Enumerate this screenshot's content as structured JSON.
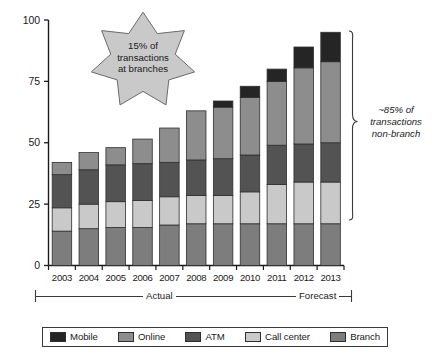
{
  "chart_data": {
    "type": "bar",
    "subtype": "stacked-vertical",
    "title": "",
    "xlabel": "",
    "ylabel": "",
    "ylim": [
      0,
      100
    ],
    "yticks": [
      0,
      25,
      50,
      75,
      100
    ],
    "ytick_labels": [
      "0",
      "25",
      "50",
      "75",
      "100"
    ],
    "grid": false,
    "legend_position": "bottom",
    "categories": [
      "2003",
      "2004",
      "2005",
      "2006",
      "2007",
      "2008",
      "2009",
      "2010",
      "2011",
      "2012",
      "2013"
    ],
    "series": [
      {
        "name": "Branch",
        "color": "#7d7d7d",
        "values": [
          14,
          15,
          15.5,
          15.5,
          16.5,
          17,
          17,
          17,
          17,
          17,
          17
        ]
      },
      {
        "name": "Call center",
        "color": "#c9c9c9",
        "values": [
          9.5,
          10,
          10.5,
          11,
          11.5,
          11.5,
          11.5,
          13,
          16,
          17,
          17
        ]
      },
      {
        "name": "ATM",
        "color": "#535353",
        "values": [
          13.5,
          14,
          15,
          15,
          14,
          14.5,
          15,
          15,
          16,
          15.5,
          16
        ]
      },
      {
        "name": "Online",
        "color": "#8d8d8d",
        "values": [
          5,
          7,
          7,
          10,
          14,
          20,
          21,
          23.5,
          26,
          31,
          33
        ]
      },
      {
        "name": "Mobile",
        "color": "#252525",
        "values": [
          0,
          0,
          0,
          0,
          0,
          0,
          2.5,
          4.5,
          5,
          8.5,
          12
        ]
      }
    ],
    "totals": [
      42,
      46,
      48,
      51.5,
      56,
      63,
      68,
      73,
      80,
      89,
      95
    ],
    "stack_order_bottom_to_top": [
      "Branch",
      "Call center",
      "ATM",
      "Online",
      "Mobile"
    ],
    "legend": [
      {
        "label": "Mobile",
        "color": "#252525"
      },
      {
        "label": "Online",
        "color": "#8d8d8d"
      },
      {
        "label": "ATM",
        "color": "#535353"
      },
      {
        "label": "Call center",
        "color": "#c9c9c9"
      },
      {
        "label": "Branch",
        "color": "#7d7d7d"
      }
    ],
    "annotations": {
      "star_callout": {
        "icon": "star-burst",
        "lines": [
          "15% of",
          "transactions",
          "at branches"
        ],
        "fill": "#c9c9c9"
      },
      "brace_note": {
        "icon": "curly-brace-right",
        "lines": [
          "~85% of",
          "transactions",
          "non-branch"
        ],
        "style": "italic"
      },
      "period_bands": [
        {
          "label": "Actual",
          "from": "2003",
          "to": "2010"
        },
        {
          "label": "Forecast",
          "from": "2011",
          "to": "2013"
        }
      ]
    }
  },
  "axis": {
    "y_labels": [
      "100",
      "75",
      "50",
      "25",
      "0"
    ],
    "x_labels": [
      "2003",
      "2004",
      "2005",
      "2006",
      "2007",
      "2008",
      "2009",
      "2010",
      "2011",
      "2012",
      "2013"
    ]
  },
  "callout": {
    "line1": "15% of",
    "line2": "transactions",
    "line3": "at branches"
  },
  "brace_note": {
    "line1": "~85% of",
    "line2": "transactions",
    "line3": "non-branch"
  },
  "periods": {
    "actual": "Actual",
    "forecast": "Forecast"
  },
  "legend": {
    "items": [
      {
        "label": "Mobile"
      },
      {
        "label": "Online"
      },
      {
        "label": "ATM"
      },
      {
        "label": "Call center"
      },
      {
        "label": "Branch"
      }
    ]
  },
  "colors": {
    "mobile": "#252525",
    "online": "#8d8d8d",
    "atm": "#535353",
    "call_center": "#c9c9c9",
    "branch": "#7d7d7d",
    "axis": "#1a1a1a",
    "star_fill": "#c9c9c9"
  }
}
